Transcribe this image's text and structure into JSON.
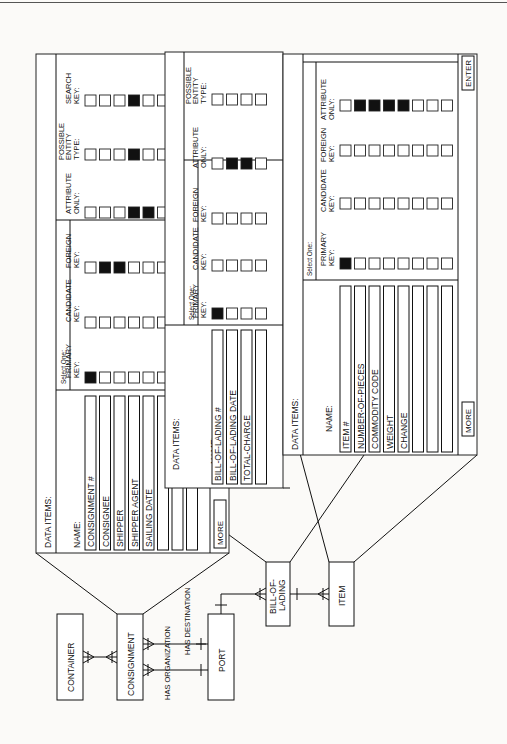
{
  "panels": [
    {
      "id": "consignment",
      "title": "DATA ITEMS:",
      "name_label": "NAME:",
      "select_one_label": "Select One:",
      "items": [
        "CONSIGNMENT #",
        "CONSIGNEE",
        "SHIPPER",
        "SHIPPER AGENT",
        "SAILING DATE",
        "",
        "",
        ""
      ],
      "columns": [
        {
          "label": [
            "PRIMARY",
            "KEY:"
          ],
          "checked": [
            1
          ]
        },
        {
          "label": [
            "CANDIDATE",
            "KEY:"
          ],
          "checked": []
        },
        {
          "label": [
            "FOREIGN",
            "KEY:"
          ],
          "checked": [
            2,
            3
          ]
        },
        {
          "label": [
            "ATTRIBUTE",
            "ONLY:"
          ],
          "checked": [
            4,
            5
          ]
        },
        {
          "label": [
            "POSSIBLE",
            "ENTITY",
            "TYPE:"
          ],
          "checked": [
            4
          ]
        },
        {
          "label": [
            "SEARCH",
            "KEY:"
          ],
          "checked": [
            4
          ]
        }
      ],
      "more_button": "MORE"
    },
    {
      "id": "bill-of-lading",
      "title": "DATA ITEMS:",
      "name_label": "NAME:",
      "select_one_label": "Select One:",
      "items": [
        "BILL-OF-LADING #",
        "BILL-OF-LADING DATE",
        "TOTAL-CHARGE",
        ""
      ],
      "columns": [
        {
          "label": [
            "PRIMARY",
            "KEY:"
          ],
          "checked": [
            1
          ]
        },
        {
          "label": [
            "CANDIDATE",
            "KEY:"
          ],
          "checked": []
        },
        {
          "label": [
            "FOREIGN",
            "KEY:"
          ],
          "checked": []
        },
        {
          "label": [
            "ATTRIBUTE",
            "ONLY:"
          ],
          "checked": [
            2,
            3
          ]
        },
        {
          "label": [
            "POSSIBLE",
            "ENTITY",
            "TYPE:"
          ],
          "checked": []
        }
      ],
      "more_button": "MORE"
    },
    {
      "id": "item",
      "title": "DATA ITEMS:",
      "name_label": "NAME:",
      "select_one_label": "Select One:",
      "items": [
        "ITEM #",
        "NUMBER-OF-PIECES",
        "COMMODITY CODE",
        "WEIGHT",
        "CHANGE",
        "",
        "",
        ""
      ],
      "columns": [
        {
          "label": [
            "PRIMARY",
            "KEY:"
          ],
          "checked": [
            1
          ]
        },
        {
          "label": [
            "CANDIDATE",
            "KEY:"
          ],
          "checked": []
        },
        {
          "label": [
            "FOREIGN",
            "KEY:"
          ],
          "checked": []
        },
        {
          "label": [
            "ATTRIBUTE",
            "ONLY:"
          ],
          "checked": [
            2,
            3,
            4,
            5
          ]
        }
      ],
      "more_button": "MORE",
      "enter_button": "ENTER"
    }
  ],
  "entities": {
    "container": "CONTAINER",
    "consignment": "CONSIGNMENT",
    "port": "PORT",
    "bill_of_lading": [
      "BILL-OF-",
      "LADING"
    ],
    "item": "ITEM"
  },
  "relationships": {
    "has_organization": "HAS ORGANIZATION",
    "has_destination": "HAS DESTINATION"
  }
}
